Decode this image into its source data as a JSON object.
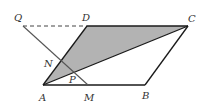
{
  "diagram": {
    "labels": {
      "Q": "Q",
      "D": "D",
      "C": "C",
      "N": "N",
      "P": "P",
      "A": "A",
      "M": "M",
      "B": "B"
    },
    "shaded_region": "triangle ADC",
    "colors": {
      "shade": "#b3b3b3",
      "line": "#1a1a1a"
    }
  }
}
